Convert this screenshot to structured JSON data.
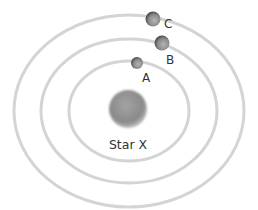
{
  "diagram": {
    "title": "",
    "star": {
      "label": "Star X",
      "color": "#8c8c8c"
    },
    "orbits": [
      {
        "name": "inner",
        "planet": "A"
      },
      {
        "name": "middle",
        "planet": "B"
      },
      {
        "name": "outer",
        "planet": "C"
      }
    ],
    "planets": [
      {
        "label": "A",
        "orbit": "inner"
      },
      {
        "label": "B",
        "orbit": "middle"
      },
      {
        "label": "C",
        "orbit": "outer"
      }
    ],
    "colors": {
      "orbit": "#d4d4d4",
      "planet": "#7a7a7a",
      "star": "#8c8c8c",
      "text": "#333333"
    }
  }
}
